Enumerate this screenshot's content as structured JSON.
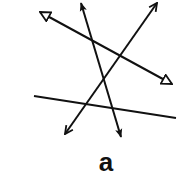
{
  "figure": {
    "label": "a",
    "stroke_color": "#111111",
    "background": "#ffffff"
  },
  "lines": [
    {
      "id": "line-hollow-triangle",
      "x1": 40,
      "y1": 12,
      "x2": 172,
      "y2": 84,
      "head_start": "hollow-triangle",
      "head_end": "hollow-triangle"
    },
    {
      "id": "line-filled-arrow",
      "x1": 81,
      "y1": 3,
      "x2": 121,
      "y2": 137,
      "head_start": "filled-arrow",
      "head_end": "filled-arrow"
    },
    {
      "id": "line-open-arrow",
      "x1": 157,
      "y1": 3,
      "x2": 65,
      "y2": 134,
      "head_start": "open-arrow",
      "head_end": "open-arrow"
    },
    {
      "id": "line-plain",
      "x1": 34,
      "y1": 96,
      "x2": 176,
      "y2": 118,
      "head_start": "none",
      "head_end": "none"
    }
  ]
}
